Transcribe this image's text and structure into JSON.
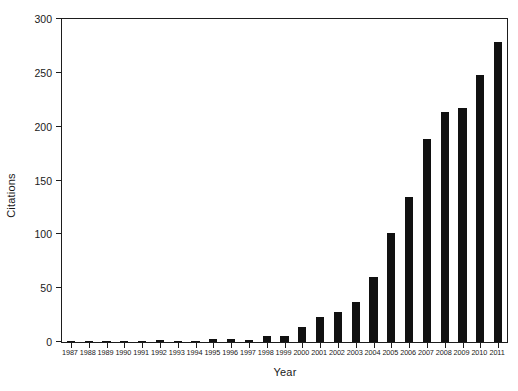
{
  "chart_data": {
    "type": "bar",
    "title": "",
    "xlabel": "Year",
    "ylabel": "Citations",
    "categories": [
      "1987",
      "1988",
      "1989",
      "1990",
      "1991",
      "1992",
      "1993",
      "1994",
      "1995",
      "1996",
      "1997",
      "1998",
      "1999",
      "2000",
      "2001",
      "2002",
      "2003",
      "2004",
      "2005",
      "2006",
      "2007",
      "2008",
      "2009",
      "2010",
      "2011"
    ],
    "values": [
      1,
      1,
      0,
      1,
      1,
      2,
      0,
      0,
      3,
      3,
      2,
      6,
      6,
      14,
      23,
      28,
      37,
      60,
      101,
      135,
      189,
      214,
      217,
      248,
      279
    ],
    "ylim": [
      0,
      300
    ],
    "yticks": [
      0,
      50,
      100,
      150,
      200,
      250,
      300
    ],
    "ytick_labels": [
      "0",
      "50",
      "100",
      "150",
      "200",
      "250",
      "300"
    ],
    "grid": false,
    "legend": null,
    "bar_color": "#111111",
    "axis_color": "#1d1d1d"
  }
}
